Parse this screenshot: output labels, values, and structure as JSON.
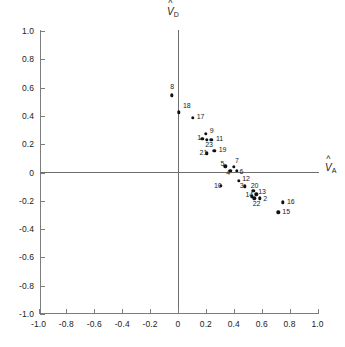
{
  "chart_data": {
    "type": "scatter",
    "title": "",
    "xlabel": "V̂_A",
    "ylabel": "V̂_D",
    "xlabel_plain": "VA",
    "ylabel_plain": "VD",
    "xlim": [
      -1.0,
      1.0
    ],
    "ylim": [
      -1.0,
      1.0
    ],
    "grid": false,
    "legend": null,
    "xticks": [
      {
        "value": -1.0,
        "label": "-1.0"
      },
      {
        "value": -0.8,
        "label": "-0.8"
      },
      {
        "value": -0.6,
        "label": "-0.6"
      },
      {
        "value": -0.4,
        "label": "-0.4"
      },
      {
        "value": -0.2,
        "label": "-0.2"
      },
      {
        "value": 0.0,
        "label": "0"
      },
      {
        "value": 0.2,
        "label": "0.2"
      },
      {
        "value": 0.4,
        "label": "0.4"
      },
      {
        "value": 0.6,
        "label": "0.6"
      },
      {
        "value": 0.8,
        "label": "0.8"
      },
      {
        "value": 1.0,
        "label": "1.0"
      }
    ],
    "yticks": [
      {
        "value": 1.0,
        "label": "1.0"
      },
      {
        "value": 0.8,
        "label": "0.8"
      },
      {
        "value": 0.6,
        "label": "0.6"
      },
      {
        "value": 0.4,
        "label": "0.4"
      },
      {
        "value": 0.2,
        "label": "0.2"
      },
      {
        "value": 0.0,
        "label": "0"
      },
      {
        "value": -0.2,
        "label": "-0.2"
      },
      {
        "value": -0.4,
        "label": "-0.4"
      },
      {
        "value": -0.6,
        "label": "-0.6"
      },
      {
        "value": -0.8,
        "label": "-0.8"
      },
      {
        "value": -1.0,
        "label": "-1.0"
      }
    ],
    "points": [
      {
        "label": "8",
        "x": -0.045,
        "y": 0.545,
        "lx": -0.055,
        "ly": 0.605
      },
      {
        "label": "18",
        "x": 0.005,
        "y": 0.425,
        "lx": 0.035,
        "ly": 0.47
      },
      {
        "label": "17",
        "x": 0.105,
        "y": 0.385,
        "lx": 0.135,
        "ly": 0.395
      },
      {
        "label": "9",
        "x": 0.2,
        "y": 0.275,
        "lx": 0.228,
        "ly": 0.292
      },
      {
        "label": "1",
        "x": 0.175,
        "y": 0.238,
        "lx": 0.138,
        "ly": 0.245
      },
      {
        "label": "23",
        "x": 0.205,
        "y": 0.232,
        "lx": 0.195,
        "ly": 0.193
      },
      {
        "label": "11",
        "x": 0.24,
        "y": 0.23,
        "lx": 0.272,
        "ly": 0.24
      },
      {
        "label": "21",
        "x": 0.208,
        "y": 0.135,
        "lx": 0.155,
        "ly": 0.14
      },
      {
        "label": "19",
        "x": 0.26,
        "y": 0.155,
        "lx": 0.292,
        "ly": 0.162
      },
      {
        "label": "5",
        "x": 0.34,
        "y": 0.045,
        "lx": 0.305,
        "ly": 0.062
      },
      {
        "label": "4",
        "x": 0.375,
        "y": 0.012,
        "lx": 0.345,
        "ly": 0.0
      },
      {
        "label": "7",
        "x": 0.4,
        "y": 0.042,
        "lx": 0.408,
        "ly": 0.08
      },
      {
        "label": "6",
        "x": 0.42,
        "y": 0.012,
        "lx": 0.44,
        "ly": 0.005
      },
      {
        "label": "12",
        "x": 0.435,
        "y": -0.058,
        "lx": 0.46,
        "ly": -0.048
      },
      {
        "label": "10",
        "x": 0.308,
        "y": -0.092,
        "lx": 0.258,
        "ly": -0.092
      },
      {
        "label": "3",
        "x": 0.478,
        "y": -0.098,
        "lx": 0.443,
        "ly": -0.098
      },
      {
        "label": "20",
        "x": 0.54,
        "y": -0.13,
        "lx": 0.522,
        "ly": -0.098
      },
      {
        "label": "13",
        "x": 0.562,
        "y": -0.155,
        "lx": 0.575,
        "ly": -0.138
      },
      {
        "label": "14",
        "x": 0.53,
        "y": -0.168,
        "lx": 0.483,
        "ly": -0.16
      },
      {
        "label": "2",
        "x": 0.585,
        "y": -0.182,
        "lx": 0.612,
        "ly": -0.19
      },
      {
        "label": "22",
        "x": 0.548,
        "y": -0.182,
        "lx": 0.535,
        "ly": -0.222
      },
      {
        "label": "16",
        "x": 0.752,
        "y": -0.212,
        "lx": 0.782,
        "ly": -0.205
      },
      {
        "label": "15",
        "x": 0.718,
        "y": -0.282,
        "lx": 0.748,
        "ly": -0.282
      }
    ]
  },
  "axis": {
    "y_title_var": "V",
    "y_title_sub": "D",
    "x_title_var": "V",
    "x_title_sub": "A",
    "hat": "ˆ"
  },
  "colors": {
    "point": "#111111",
    "axis": "#6e6e6e",
    "text": "#1a1a1a",
    "background": "#ffffff"
  }
}
